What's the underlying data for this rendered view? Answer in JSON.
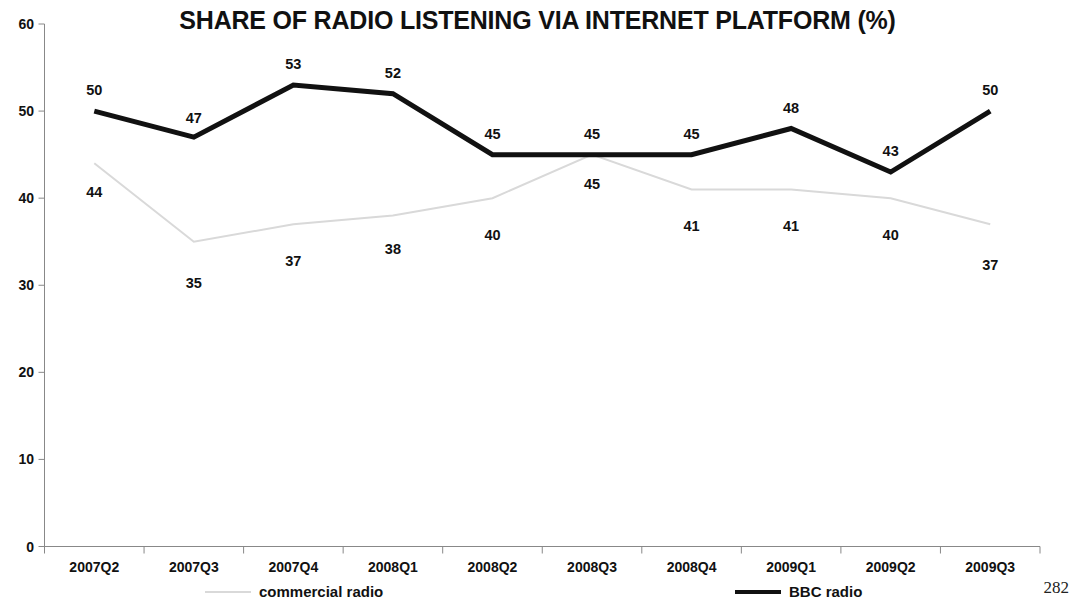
{
  "page_number": "282",
  "chart_data": {
    "type": "line",
    "title": "SHARE OF RADIO LISTENING VIA INTERNET PLATFORM (%)",
    "xlabel": "",
    "ylabel": "",
    "ylim": [
      0,
      60
    ],
    "ytick_step": 10,
    "yticks": [
      "0",
      "10",
      "20",
      "30",
      "40",
      "50",
      "60"
    ],
    "grid": false,
    "legend_position": "bottom",
    "categories": [
      "2007Q2",
      "2007Q3",
      "2007Q4",
      "2008Q1",
      "2008Q2",
      "2008Q3",
      "2008Q4",
      "2009Q1",
      "2009Q2",
      "2009Q3"
    ],
    "series": [
      {
        "name": "commercial radio",
        "color": "#d9d9d9",
        "line_width": 2,
        "values": [
          44,
          35,
          37,
          38,
          40,
          45,
          41,
          41,
          40,
          37
        ],
        "label_offsets_y": [
          22,
          34,
          30,
          26,
          30,
          22,
          30,
          30,
          30,
          34
        ]
      },
      {
        "name": "BBC radio",
        "color": "#111111",
        "line_width": 5,
        "values": [
          50,
          47,
          53,
          52,
          45,
          45,
          45,
          48,
          43,
          50
        ],
        "label_offsets_y": [
          -28,
          -26,
          -28,
          -28,
          -28,
          -28,
          -28,
          -28,
          -28,
          -28
        ]
      }
    ]
  },
  "legend": [
    {
      "label": "commercial radio"
    },
    {
      "label": "BBC radio"
    }
  ]
}
